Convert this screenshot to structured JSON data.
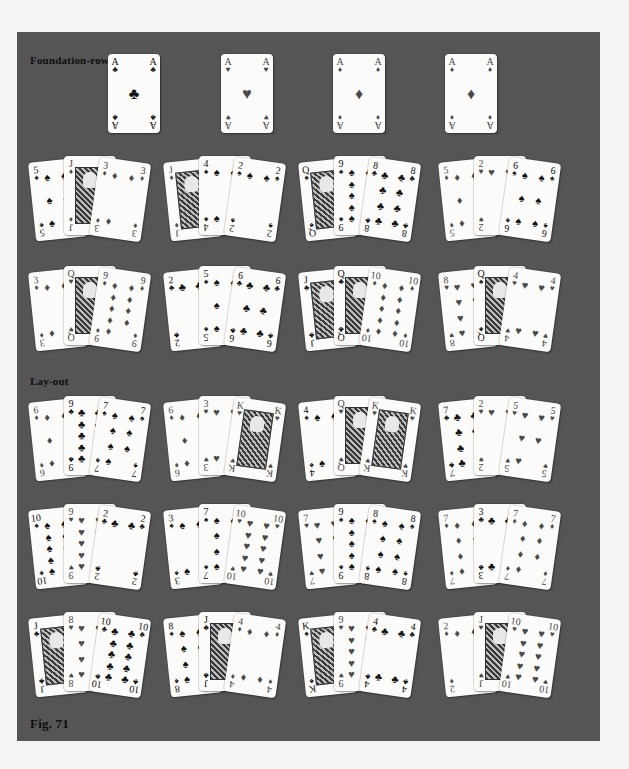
{
  "figure": {
    "caption": "Fig. 71",
    "colors": {
      "table": "#555556",
      "page": "#f4f4f2",
      "card": "#fbfbf9"
    }
  },
  "foundation": {
    "label": "Foundation-row",
    "cards": [
      {
        "rank": "A",
        "suit": "♣"
      },
      {
        "rank": "A",
        "suit": "♥"
      },
      {
        "rank": "A",
        "suit": "♦"
      },
      {
        "rank": "A",
        "suit": "♦"
      }
    ]
  },
  "reserve_rows": [
    [
      [
        {
          "rank": "5",
          "suit": "♠"
        },
        {
          "rank": "J",
          "suit": "♦"
        },
        {
          "rank": "3",
          "suit": "♦"
        }
      ],
      [
        {
          "rank": "J",
          "suit": "♦"
        },
        {
          "rank": "4",
          "suit": "♠"
        },
        {
          "rank": "2",
          "suit": "♠"
        }
      ],
      [
        {
          "rank": "Q",
          "suit": "♠"
        },
        {
          "rank": "9",
          "suit": "♠"
        },
        {
          "rank": "8",
          "suit": "♣"
        }
      ],
      [
        {
          "rank": "5",
          "suit": "♦"
        },
        {
          "rank": "2",
          "suit": "♥"
        },
        {
          "rank": "6",
          "suit": "♠"
        }
      ]
    ],
    [
      [
        {
          "rank": "3",
          "suit": "♦"
        },
        {
          "rank": "Q",
          "suit": "♥"
        },
        {
          "rank": "9",
          "suit": "♦"
        }
      ],
      [
        {
          "rank": "2",
          "suit": "♣"
        },
        {
          "rank": "5",
          "suit": "♠"
        },
        {
          "rank": "6",
          "suit": "♣"
        }
      ],
      [
        {
          "rank": "J",
          "suit": "♣"
        },
        {
          "rank": "Q",
          "suit": "♣"
        },
        {
          "rank": "10",
          "suit": "♦"
        }
      ],
      [
        {
          "rank": "8",
          "suit": "♥"
        },
        {
          "rank": "Q",
          "suit": "♠"
        },
        {
          "rank": "4",
          "suit": "♥"
        }
      ]
    ]
  ],
  "layout": {
    "label": "Lay-out",
    "rows": [
      [
        [
          {
            "rank": "6",
            "suit": "♦"
          },
          {
            "rank": "9",
            "suit": "♣"
          },
          {
            "rank": "7",
            "suit": "♠"
          }
        ],
        [
          {
            "rank": "6",
            "suit": "♦"
          },
          {
            "rank": "3",
            "suit": "♥"
          },
          {
            "rank": "K",
            "suit": "♥"
          }
        ],
        [
          {
            "rank": "4",
            "suit": "♠"
          },
          {
            "rank": "Q",
            "suit": "♥"
          },
          {
            "rank": "K",
            "suit": "♥"
          }
        ],
        [
          {
            "rank": "7",
            "suit": "♣"
          },
          {
            "rank": "2",
            "suit": "♥"
          },
          {
            "rank": "5",
            "suit": "♥"
          }
        ]
      ],
      [
        [
          {
            "rank": "10",
            "suit": "♠"
          },
          {
            "rank": "9",
            "suit": "♥"
          },
          {
            "rank": "2",
            "suit": "♣"
          }
        ],
        [
          {
            "rank": "3",
            "suit": "♠"
          },
          {
            "rank": "7",
            "suit": "♠"
          },
          {
            "rank": "10",
            "suit": "♥"
          }
        ],
        [
          {
            "rank": "7",
            "suit": "♥"
          },
          {
            "rank": "9",
            "suit": "♠"
          },
          {
            "rank": "8",
            "suit": "♠"
          }
        ],
        [
          {
            "rank": "7",
            "suit": "♦"
          },
          {
            "rank": "3",
            "suit": "♣"
          },
          {
            "rank": "7",
            "suit": "♦"
          }
        ]
      ],
      [
        [
          {
            "rank": "J",
            "suit": "♣"
          },
          {
            "rank": "8",
            "suit": "♥"
          },
          {
            "rank": "10",
            "suit": "♣"
          }
        ],
        [
          {
            "rank": "8",
            "suit": "♠"
          },
          {
            "rank": "J",
            "suit": "♣"
          },
          {
            "rank": "4",
            "suit": "♦"
          }
        ],
        [
          {
            "rank": "K",
            "suit": "♠"
          },
          {
            "rank": "9",
            "suit": "♥"
          },
          {
            "rank": "4",
            "suit": "♣"
          }
        ],
        [
          {
            "rank": "2",
            "suit": "♦"
          },
          {
            "rank": "J",
            "suit": "♥"
          },
          {
            "rank": "10",
            "suit": "♥"
          }
        ]
      ]
    ]
  }
}
